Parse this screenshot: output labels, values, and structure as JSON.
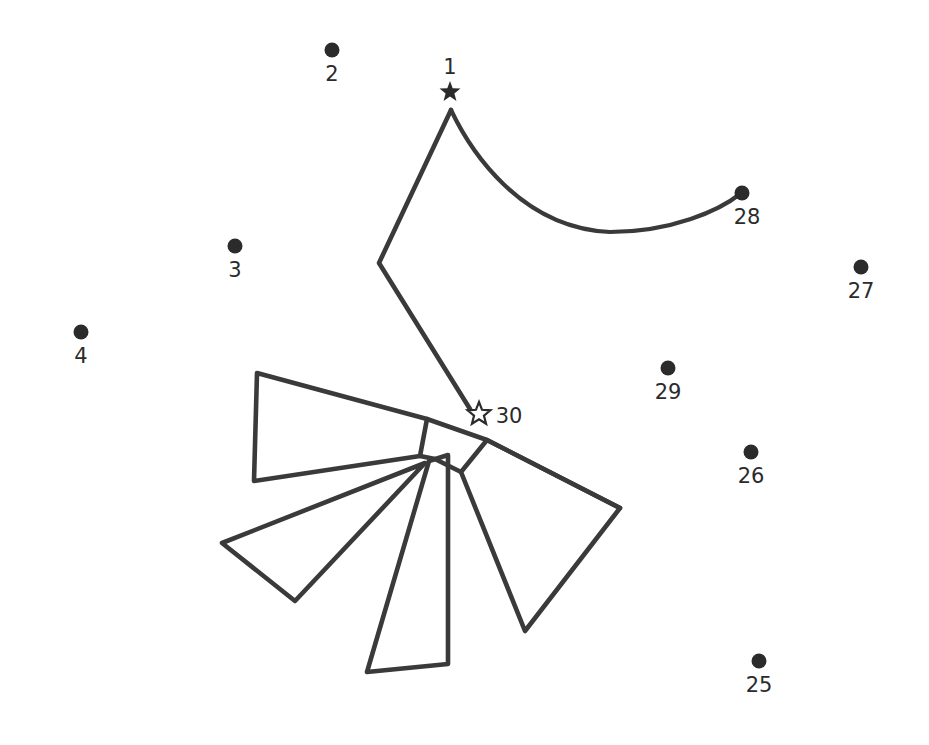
{
  "page": {
    "background_color": "#ffffff",
    "ink_color": "#3a3a3a",
    "dot_color": "#2b2b2b",
    "width": 929,
    "height": 745
  },
  "markers": [
    {
      "id": "1",
      "label": "1",
      "type": "star-filled",
      "x": 450,
      "y": 92,
      "label_x": 450,
      "label_y": 74,
      "radius": 0
    },
    {
      "id": "2",
      "label": "2",
      "type": "dot",
      "x": 332,
      "y": 50,
      "label_x": 332,
      "label_y": 81,
      "radius": 7.5
    },
    {
      "id": "3",
      "label": "3",
      "type": "dot",
      "x": 235,
      "y": 246,
      "label_x": 235,
      "label_y": 277,
      "radius": 7.5
    },
    {
      "id": "4",
      "label": "4",
      "type": "dot",
      "x": 81,
      "y": 332,
      "label_x": 81,
      "label_y": 363,
      "radius": 7.5
    },
    {
      "id": "25",
      "label": "25",
      "type": "dot",
      "x": 759,
      "y": 661,
      "label_x": 759,
      "label_y": 692,
      "radius": 7.5
    },
    {
      "id": "26",
      "label": "26",
      "type": "dot",
      "x": 751,
      "y": 452,
      "label_x": 751,
      "label_y": 483,
      "radius": 7.5
    },
    {
      "id": "27",
      "label": "27",
      "type": "dot",
      "x": 861,
      "y": 267,
      "label_x": 861,
      "label_y": 298,
      "radius": 7.5
    },
    {
      "id": "28",
      "label": "28",
      "type": "dot",
      "x": 742,
      "y": 193,
      "label_x": 747,
      "label_y": 224,
      "radius": 7.5
    },
    {
      "id": "29",
      "label": "29",
      "type": "dot",
      "x": 668,
      "y": 368,
      "label_x": 668,
      "label_y": 399,
      "radius": 7.5
    },
    {
      "id": "30",
      "label": "30",
      "type": "star-hollow",
      "x": 479,
      "y": 414,
      "label_x": 509,
      "label_y": 423,
      "radius": 0
    }
  ],
  "strokes": {
    "curve_1_to_28": "M 451 110 C 470 150, 520 228, 610 232 C 672 232, 720 210, 740 194",
    "neck_polyline": "M 451 110 L 379 263 L 470 409",
    "wing_upper_left": "M 257 373 L 427 419 L 420 456 L 254 481 Z",
    "wing_mid_left": "M 425 463 L 222 543 L 295 601 Z",
    "wing_lower_center": "M 429 461 L 367 672 L 448 664 L 448 455 Z",
    "wing_right": "M 461 472 L 487 440 L 620 508 L 525 631 Z",
    "spine_right": "M 427 419 L 487 440 L 620 508",
    "hub_connector": "M 420 456 L 435 459 L 461 472"
  },
  "legend": {
    "start_marker_note": "1",
    "end_marker_note": "30"
  }
}
